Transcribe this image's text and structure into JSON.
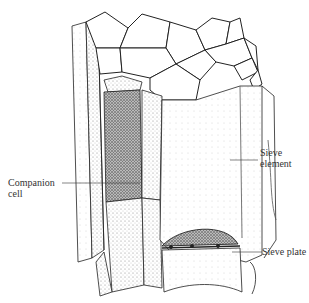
{
  "figure": {
    "type": "biological-illustration",
    "labels": {
      "sieve_element": [
        "Sieve",
        "element"
      ],
      "companion_cell": [
        "Companion",
        "cell"
      ],
      "sieve_plate": "Sieve plate"
    }
  }
}
